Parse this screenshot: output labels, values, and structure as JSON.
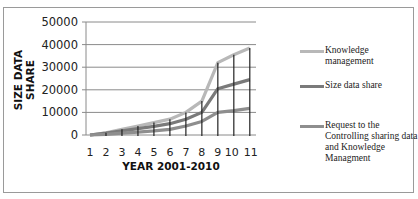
{
  "chart_data": {
    "type": "line",
    "title": "",
    "xlabel": "YEAR 2001-2010",
    "ylabel": "SIZE DATA SHARE",
    "categories": [
      "1",
      "2",
      "3",
      "4",
      "5",
      "6",
      "7",
      "8",
      "9",
      "10",
      "11"
    ],
    "yticks": [
      "0",
      "10000",
      "20000",
      "30000",
      "40000",
      "50000"
    ],
    "ylim": [
      0,
      50000
    ],
    "grid": true,
    "legend_position": "right",
    "series": [
      {
        "name": "Knowledge management",
        "color": "#b8b8b8",
        "values": [
          0,
          1000,
          2500,
          4000,
          5500,
          7000,
          10000,
          15000,
          32000,
          35500,
          38500
        ]
      },
      {
        "name": "Size data share",
        "color": "#7a7a7a",
        "values": [
          0,
          800,
          1800,
          2800,
          3800,
          5000,
          7000,
          10000,
          20500,
          22500,
          24500
        ]
      },
      {
        "name": "Request to the Controlling sharing data and Knowledge Managment",
        "color": "#8e8e8e",
        "values": [
          0,
          300,
          800,
          1300,
          1800,
          2500,
          4000,
          6000,
          10000,
          10800,
          11800
        ]
      }
    ]
  },
  "legend": {
    "items": [
      {
        "label": "Knowledge management",
        "color": "#b8b8b8"
      },
      {
        "label": "Size data share",
        "color": "#7a7a7a"
      },
      {
        "label": "Request to the Controlling sharing data and Knowledge Managment",
        "color": "#8e8e8e"
      }
    ]
  }
}
